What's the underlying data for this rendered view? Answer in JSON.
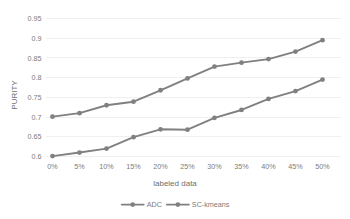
{
  "chart_data": {
    "type": "line",
    "title": "",
    "xlabel": "labeled data",
    "ylabel": "PURITY",
    "categories": [
      "0%",
      "5%",
      "10%",
      "15%",
      "20%",
      "25%",
      "30%",
      "35%",
      "40%",
      "45%",
      "50%"
    ],
    "series": [
      {
        "name": "ADC",
        "color": "#808080",
        "values": [
          0.701,
          0.71,
          0.73,
          0.739,
          0.768,
          0.798,
          0.828,
          0.838,
          0.847,
          0.866,
          0.895
        ]
      },
      {
        "name": "SC-kmeans",
        "color": "#808080",
        "values": [
          0.601,
          0.61,
          0.62,
          0.649,
          0.669,
          0.668,
          0.698,
          0.718,
          0.746,
          0.766,
          0.795
        ]
      }
    ],
    "yticks": [
      "0.6",
      "0.65",
      "0.7",
      "0.75",
      "0.8",
      "0.85",
      "0.9",
      "0.95"
    ],
    "ytick_values": [
      0.6,
      0.65,
      0.7,
      0.75,
      0.8,
      0.85,
      0.9,
      0.95
    ],
    "ylim": [
      0.6,
      0.95
    ],
    "grid": true,
    "legend_position": "bottom",
    "legend": [
      "ADC",
      "SC-kmeans"
    ]
  }
}
